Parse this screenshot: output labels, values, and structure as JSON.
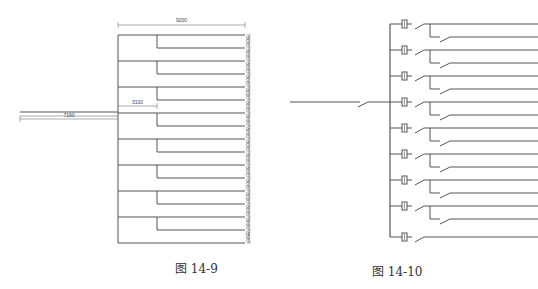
{
  "figures": [
    {
      "id": "fig-14-9",
      "caption": "图 14-9",
      "dimensions": {
        "top_width": "9200",
        "branch_offset": "3100",
        "feed_length": "7160",
        "row_spacing": [
          "3000",
          "3000",
          "3000",
          "3000",
          "3000",
          "3000",
          "3000",
          "3000",
          "3000",
          "3000",
          "3000",
          "3000",
          "3000",
          "3000",
          "3000",
          "3500"
        ]
      },
      "layout": {
        "trunk_x": 118,
        "branch_x": 157,
        "right_x": 245,
        "main_rows_y": [
          35,
          61,
          87,
          113,
          139,
          165,
          191,
          217,
          243
        ],
        "branch_rows_y": [
          48,
          74,
          100,
          126,
          152,
          178,
          204,
          230
        ],
        "feed_y": 113,
        "feed_start_x": 20
      }
    },
    {
      "id": "fig-14-10",
      "caption": "图 14-10",
      "layout": {
        "bus_x": 390,
        "breaker_x": 402,
        "branch_x": 430,
        "end_x": 538,
        "rows_y": [
          24,
          50,
          76,
          102,
          128,
          154,
          180,
          206,
          237
        ],
        "feed_y": 102,
        "feed_start_x": 290
      }
    }
  ],
  "colors": {
    "line": "#555555",
    "caption": "#333333"
  }
}
